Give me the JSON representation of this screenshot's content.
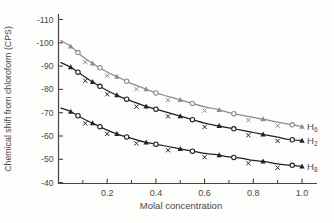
{
  "figure": {
    "background": "#fdfdfc",
    "axis_color": "#46443f",
    "text_color": "#4a4845"
  },
  "chart_data": {
    "type": "line",
    "title": "",
    "xlabel": "Molal concentration",
    "ylabel": "Chemical shift from chloroform (CPS)",
    "xlim": [
      0,
      1.06
    ],
    "ylim": [
      -110,
      -40
    ],
    "y_axis_inverted_display": "(-110 at top, -40 at bottom)",
    "grid": false,
    "xticks_major": [
      0.2,
      0.4,
      0.6,
      0.8,
      1.0
    ],
    "xtick_labels": [
      "0.2",
      "0.4",
      "0.6",
      "0.8",
      "1.0"
    ],
    "xticks_minor": [
      0.1,
      0.3,
      0.5,
      0.7,
      0.9
    ],
    "yticks": [
      -110,
      -100,
      -90,
      -80,
      -70,
      -60,
      -50,
      -40
    ],
    "ytick_labels": [
      "-110",
      "-100",
      "-90",
      "-80",
      "-70",
      "-60",
      "-50",
      "-40"
    ],
    "legend_position": "labels-at-line-ends-right",
    "marker_xs": [
      0.05,
      0.08,
      0.11,
      0.14,
      0.17,
      0.2,
      0.24,
      0.28,
      0.32,
      0.36,
      0.4,
      0.45,
      0.5,
      0.55,
      0.6,
      0.66,
      0.72,
      0.78,
      0.84,
      0.9,
      0.96,
      1.0
    ],
    "marker_types": [
      "triangle",
      "circle",
      "x",
      "triangle",
      "circle",
      "x",
      "triangle",
      "circle",
      "x",
      "triangle",
      "circle",
      "x",
      "triangle",
      "circle",
      "x",
      "triangle",
      "circle",
      "x",
      "triangle",
      "x",
      "circle",
      "triangle"
    ],
    "x_marker_value_offset": 1.6,
    "series": [
      {
        "name": "H6",
        "label_base": "H",
        "label_sub": "6",
        "color": "#8e8c88",
        "points": [
          [
            0.01,
            -101
          ],
          [
            0.05,
            -98.5
          ],
          [
            0.1,
            -94
          ],
          [
            0.15,
            -90.5
          ],
          [
            0.2,
            -87.5
          ],
          [
            0.25,
            -85
          ],
          [
            0.3,
            -82.5
          ],
          [
            0.35,
            -80.5
          ],
          [
            0.4,
            -78.5
          ],
          [
            0.45,
            -77
          ],
          [
            0.5,
            -75.5
          ],
          [
            0.55,
            -74
          ],
          [
            0.6,
            -72.5
          ],
          [
            0.65,
            -71.5
          ],
          [
            0.7,
            -70
          ],
          [
            0.75,
            -69
          ],
          [
            0.8,
            -68
          ],
          [
            0.85,
            -67
          ],
          [
            0.9,
            -66
          ],
          [
            0.95,
            -65
          ],
          [
            1.0,
            -64
          ]
        ]
      },
      {
        "name": "H2",
        "label_base": "H",
        "label_sub": "2",
        "color": "#23221f",
        "points": [
          [
            0.01,
            -91.5
          ],
          [
            0.05,
            -89.5
          ],
          [
            0.1,
            -86
          ],
          [
            0.15,
            -82.5
          ],
          [
            0.2,
            -79.5
          ],
          [
            0.25,
            -77
          ],
          [
            0.3,
            -75
          ],
          [
            0.35,
            -73
          ],
          [
            0.4,
            -71.5
          ],
          [
            0.45,
            -70
          ],
          [
            0.5,
            -68.5
          ],
          [
            0.55,
            -67
          ],
          [
            0.6,
            -65.5
          ],
          [
            0.65,
            -64.5
          ],
          [
            0.7,
            -63.5
          ],
          [
            0.75,
            -62.5
          ],
          [
            0.8,
            -61.5
          ],
          [
            0.85,
            -60.5
          ],
          [
            0.9,
            -59.5
          ],
          [
            0.95,
            -58.5
          ],
          [
            1.0,
            -58
          ]
        ]
      },
      {
        "name": "H8",
        "label_base": "H",
        "label_sub": "8",
        "color": "#23221f",
        "points": [
          [
            0.01,
            -72
          ],
          [
            0.05,
            -70.5
          ],
          [
            0.1,
            -67.5
          ],
          [
            0.15,
            -65
          ],
          [
            0.2,
            -62.5
          ],
          [
            0.25,
            -60.5
          ],
          [
            0.3,
            -59
          ],
          [
            0.35,
            -57.5
          ],
          [
            0.4,
            -56.5
          ],
          [
            0.45,
            -55.5
          ],
          [
            0.5,
            -54.5
          ],
          [
            0.55,
            -53.5
          ],
          [
            0.6,
            -52.5
          ],
          [
            0.65,
            -52
          ],
          [
            0.7,
            -51
          ],
          [
            0.75,
            -50.5
          ],
          [
            0.8,
            -49.5
          ],
          [
            0.85,
            -49
          ],
          [
            0.9,
            -48
          ],
          [
            0.95,
            -47.5
          ],
          [
            1.0,
            -47
          ]
        ]
      }
    ]
  }
}
